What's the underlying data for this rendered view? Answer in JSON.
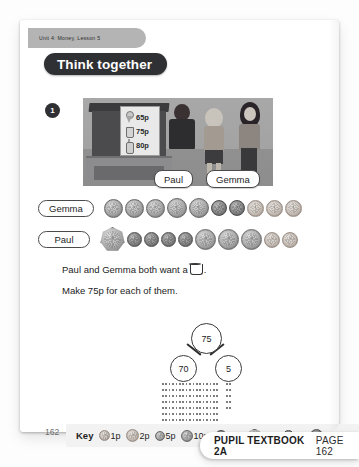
{
  "page": {
    "unit_tab": "Unit 4: Money, Lesson 5",
    "banner_title": "Think together",
    "question_number": "1",
    "page_number": "162"
  },
  "scene": {
    "menu_items": [
      {
        "icon": "ice-cream-cone-icon",
        "price": "65p"
      },
      {
        "icon": "cup-icon",
        "price": "75p"
      },
      {
        "icon": "bottle-icon",
        "price": "80p"
      }
    ],
    "name_labels": [
      "Paul",
      "Gemma"
    ]
  },
  "coin_rows": [
    {
      "name": "Gemma",
      "coins": [
        {
          "size": 17,
          "tone": "silver"
        },
        {
          "size": 17,
          "tone": "silver"
        },
        {
          "size": 17,
          "tone": "silver"
        },
        {
          "size": 18,
          "tone": "silver"
        },
        {
          "size": 18,
          "tone": "silver"
        },
        {
          "size": 14,
          "tone": "dark"
        },
        {
          "size": 14,
          "tone": "dark"
        },
        {
          "size": 15,
          "tone": "copper"
        },
        {
          "size": 15,
          "tone": "copper"
        },
        {
          "size": 15,
          "tone": "copper"
        }
      ]
    },
    {
      "name": "Paul",
      "coins": [
        {
          "size": 23,
          "tone": "silver",
          "shape": "heptagon"
        },
        {
          "size": 13,
          "tone": "dark"
        },
        {
          "size": 13,
          "tone": "dark"
        },
        {
          "size": 13,
          "tone": "dark"
        },
        {
          "size": 13,
          "tone": "dark"
        },
        {
          "size": 19,
          "tone": "silver"
        },
        {
          "size": 19,
          "tone": "silver"
        },
        {
          "size": 19,
          "tone": "silver"
        },
        {
          "size": 14,
          "tone": "copper"
        },
        {
          "size": 14,
          "tone": "copper"
        }
      ]
    }
  ],
  "body": {
    "line1_before": "Paul and Gemma both want a",
    "line1_after": ".",
    "line1_icon": "cup-icon",
    "line2": "Make 75p for each of them."
  },
  "part_whole": {
    "whole": "75",
    "part_left": "70",
    "part_right": "5",
    "answer_lines_left": 7,
    "answer_lines_right": 5
  },
  "key": {
    "label": "Key",
    "items": [
      {
        "value": "1p",
        "size": 9,
        "tone": "copper"
      },
      {
        "value": "2p",
        "size": 11,
        "tone": "copper"
      },
      {
        "value": "5p",
        "size": 8,
        "tone": "silver"
      },
      {
        "value": "10p",
        "size": 10,
        "tone": "silver"
      },
      {
        "value": "20p",
        "size": 10,
        "tone": "dark"
      },
      {
        "value": "50p",
        "size": 12,
        "tone": "silver",
        "shape": "heptagon"
      },
      {
        "value": "£1",
        "size": 9,
        "tone": "dark"
      },
      {
        "value": "£2",
        "size": 11,
        "tone": "dark"
      }
    ]
  },
  "footer": {
    "book": "PUPIL TEXTBOOK 2A",
    "page": "PAGE 162"
  }
}
